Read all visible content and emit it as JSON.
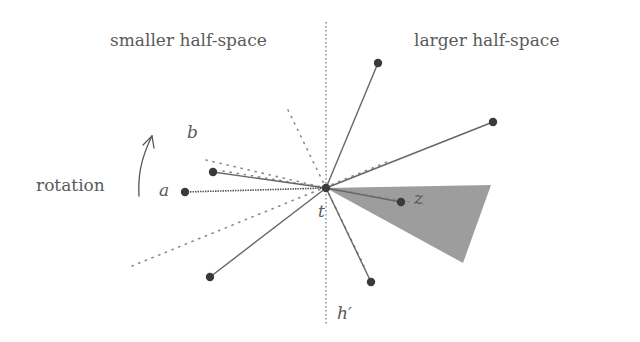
{
  "labels": {
    "smaller": "smaller half-space",
    "larger": "larger half-space",
    "rotation": "rotation",
    "a": "a",
    "b": "b",
    "t": "t",
    "z": "z",
    "h_prime": "h′"
  },
  "colors": {
    "background": "#ffffff",
    "line": "#6a6a6a",
    "point": "#3a3a3a",
    "shade": "#8c8c8c",
    "text": "#5a5a5a"
  },
  "geometry": {
    "center_t": [
      326,
      188
    ],
    "halfplane_line_x": 326,
    "points": {
      "a": [
        185,
        192
      ],
      "b": [
        213,
        172
      ],
      "top": [
        378,
        63
      ],
      "right": [
        493,
        122
      ],
      "z": [
        401,
        202
      ],
      "bottom_left": [
        210,
        277
      ],
      "bottom_right": [
        371,
        282
      ]
    },
    "shaded_wedge": [
      [
        326,
        188
      ],
      [
        491,
        185
      ],
      [
        463,
        263
      ]
    ]
  }
}
